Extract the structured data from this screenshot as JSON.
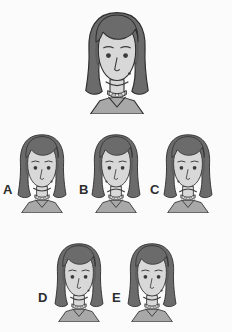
{
  "task": {
    "type": "visual-matching-multiple-choice",
    "background_color": "#fbfbfb",
    "target_caption": "",
    "options_caption": ""
  },
  "palette": {
    "hair": "#6b6b6b",
    "hair_shadow": "#5e5e5e",
    "skin": "#d8d8d8",
    "skin_line": "#3a3a3a",
    "shirt": "#a8a8a8",
    "necklace_bead": "#efefef",
    "necklace_band": "#bdbdbd",
    "outline": "#2e2e2e",
    "label_color": "#2e2e2e"
  },
  "target_figure": {
    "name": "target-face",
    "label": "",
    "expression": "smiling",
    "mouth": "smile",
    "eyebrows": "neutral",
    "mole": "right-cheek",
    "necklace": "beaded",
    "hair": "long-dark-parted",
    "x": 76,
    "y": 8,
    "width": 82,
    "height": 106
  },
  "options": [
    {
      "id": "A",
      "label": "A",
      "name": "option-a",
      "expression": "smiling",
      "mouth": "smile",
      "mole": "right-cheek",
      "necklace": "beaded",
      "x": 12,
      "y": 131,
      "width": 60,
      "height": 82,
      "label_x": 3,
      "label_y": 183
    },
    {
      "id": "B",
      "label": "B",
      "name": "option-b",
      "expression": "frowning",
      "mouth": "frown",
      "mole": "left-cheek",
      "necklace": "beaded",
      "x": 86,
      "y": 131,
      "width": 60,
      "height": 82,
      "label_x": 79,
      "label_y": 183
    },
    {
      "id": "C",
      "label": "C",
      "name": "option-c",
      "expression": "frowning",
      "mouth": "frown",
      "mole": "left-cheek",
      "necklace": "beaded",
      "x": 158,
      "y": 131,
      "width": 60,
      "height": 82,
      "label_x": 150,
      "label_y": 183
    },
    {
      "id": "D",
      "label": "D",
      "name": "option-d",
      "expression": "smiling",
      "mouth": "smile",
      "mole": "right-cheek",
      "necklace": "beaded",
      "x": 49,
      "y": 240,
      "width": 60,
      "height": 82,
      "label_x": 38,
      "label_y": 291
    },
    {
      "id": "E",
      "label": "E",
      "name": "option-e",
      "expression": "smiling",
      "mouth": "smile",
      "mole": "right-cheek",
      "necklace": "beaded",
      "x": 122,
      "y": 240,
      "width": 60,
      "height": 82,
      "label_x": 112,
      "label_y": 291
    }
  ]
}
